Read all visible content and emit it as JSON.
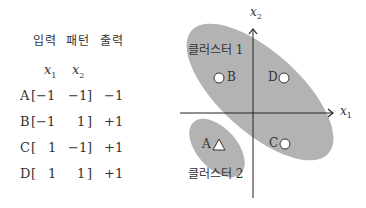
{
  "table": {
    "headers": [
      "입력",
      "패턴",
      "출력"
    ],
    "variables": [
      {
        "base": "x",
        "sub": "1"
      },
      {
        "base": "x",
        "sub": "2"
      }
    ],
    "rows": [
      {
        "label": "A",
        "open": "[",
        "x1": "−1",
        "x2": "−1",
        "close": "]",
        "output": "−1"
      },
      {
        "label": "B",
        "open": "[",
        "x1": "−1",
        "x2": "1",
        "close": "]",
        "output": "+1"
      },
      {
        "label": "C",
        "open": "[",
        "x1": "1",
        "x2": "−1",
        "close": "]",
        "output": "+1"
      },
      {
        "label": "D",
        "open": "[",
        "x1": "1",
        "x2": "1",
        "close": "]",
        "output": "+1"
      }
    ]
  },
  "diagram": {
    "x_axis": {
      "base": "x",
      "sub": "1"
    },
    "y_axis": {
      "base": "x",
      "sub": "2"
    },
    "clusters": [
      {
        "name": "클러스터 1",
        "color": "#b3b3b3"
      },
      {
        "name": "클러스터 2",
        "color": "#b3b3b3"
      }
    ],
    "points": [
      {
        "label": "B",
        "shape": "circle"
      },
      {
        "label": "D",
        "shape": "circle"
      },
      {
        "label": "C",
        "shape": "circle"
      },
      {
        "label": "A",
        "shape": "triangle"
      }
    ]
  }
}
